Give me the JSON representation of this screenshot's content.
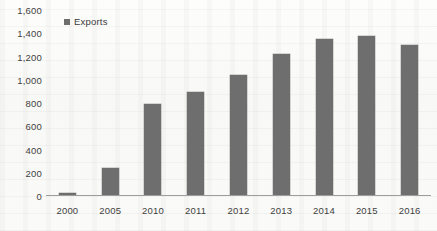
{
  "chart_data": {
    "type": "bar",
    "title": "",
    "xlabel": "",
    "ylabel": "",
    "categories": [
      "2000",
      "2005",
      "2010",
      "2011",
      "2012",
      "2013",
      "2014",
      "2015",
      "2016"
    ],
    "series": [
      {
        "name": "Exports",
        "values": [
          15,
          235,
          780,
          890,
          1030,
          1215,
          1345,
          1370,
          1290
        ],
        "color": "#6e6e6e"
      }
    ],
    "ylim": [
      0,
      1600
    ],
    "yticks": [
      0,
      200,
      400,
      600,
      800,
      1000,
      1200,
      1400,
      1600
    ],
    "ytick_labels": [
      "0",
      "200",
      "400",
      "600",
      "800",
      "1,000",
      "1,200",
      "1,400",
      "1,600"
    ],
    "grid": false,
    "legend": {
      "position": "top-left",
      "entries": [
        {
          "label": "Exports",
          "color": "#6e6e6e",
          "marker": "square"
        }
      ]
    },
    "background_color": "#fbfbfa",
    "axis_color": "#9d9d9d",
    "text_color": "#3f3f3f"
  }
}
